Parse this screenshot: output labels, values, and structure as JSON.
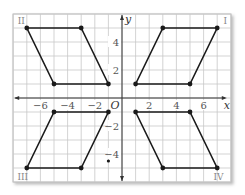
{
  "diagram": {
    "type": "coordinate-plane",
    "axes": {
      "x_label": "x",
      "y_label": "y",
      "origin_label": "O"
    },
    "x_ticks": [
      {
        "value": -6,
        "label": "−6"
      },
      {
        "value": -4,
        "label": "−4"
      },
      {
        "value": -2,
        "label": "−2"
      },
      {
        "value": 2,
        "label": "2"
      },
      {
        "value": 4,
        "label": "4"
      },
      {
        "value": 6,
        "label": "6"
      }
    ],
    "y_ticks": [
      {
        "value": 4,
        "label": "4"
      },
      {
        "value": 2,
        "label": "2"
      },
      {
        "value": -2,
        "label": "−2"
      },
      {
        "value": -4,
        "label": "−4"
      }
    ],
    "xlim": [
      -8,
      8
    ],
    "ylim": [
      -6,
      6
    ],
    "quadrant_labels": [
      {
        "label": "I",
        "x": 7.6,
        "y": 5.6
      },
      {
        "label": "II",
        "x": -7.4,
        "y": 5.6
      },
      {
        "label": "III",
        "x": -7.3,
        "y": -5.6
      },
      {
        "label": "IV",
        "x": 7.1,
        "y": -5.6
      }
    ],
    "parallelograms": [
      {
        "quadrant": "I",
        "vertices": [
          [
            1,
            1
          ],
          [
            5,
            1
          ],
          [
            7,
            5
          ],
          [
            3,
            5
          ]
        ]
      },
      {
        "quadrant": "II",
        "vertices": [
          [
            -7,
            5
          ],
          [
            -3,
            5
          ],
          [
            -1,
            1
          ],
          [
            -5,
            1
          ]
        ]
      },
      {
        "quadrant": "III",
        "vertices": [
          [
            -5,
            -1
          ],
          [
            -1,
            -1
          ],
          [
            -3,
            -5
          ],
          [
            -7,
            -5
          ]
        ]
      },
      {
        "quadrant": "IV",
        "vertices": [
          [
            1,
            -1
          ],
          [
            5,
            -1
          ],
          [
            7,
            -5
          ],
          [
            3,
            -5
          ]
        ]
      }
    ],
    "extra_points": [
      [
        -1,
        -4.5
      ]
    ],
    "colors": {
      "grid": "#c8c8c8",
      "shape": "#1a1a1a",
      "axis": "#333333",
      "label": "#555555",
      "quadrant_label": "#888888"
    }
  }
}
